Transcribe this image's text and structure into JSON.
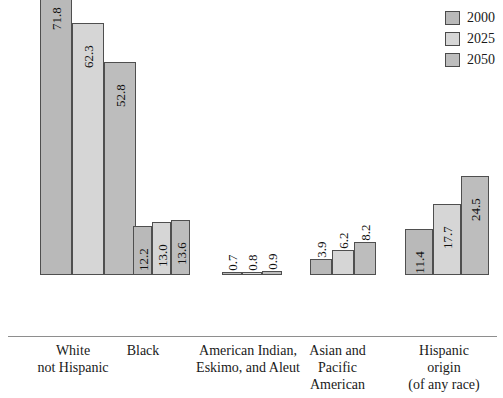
{
  "chart_data": {
    "type": "bar",
    "title": "",
    "subtitle": "",
    "xlabel": "",
    "ylabel": "",
    "ylim": [
      0,
      75
    ],
    "grid": false,
    "legend_position": "top-right",
    "categories": [
      "White not Hispanic",
      "Black",
      "American Indian, Eskimo, and Aleut",
      "Asian and Pacific American",
      "Hispanic origin (of any race)"
    ],
    "category_lines": [
      [
        "White",
        "not Hispanic"
      ],
      [
        "Black"
      ],
      [
        "American Indian,",
        "Eskimo, and Aleut"
      ],
      [
        "Asian and",
        "Pacific",
        "American"
      ],
      [
        "Hispanic",
        "origin",
        "(of any race)"
      ]
    ],
    "series": [
      {
        "name": "2000",
        "color": "#b9b9b9",
        "values": [
          71.8,
          12.2,
          0.7,
          3.9,
          11.4
        ]
      },
      {
        "name": "2025",
        "color": "#d6d6d6",
        "values": [
          62.3,
          13.0,
          0.8,
          6.2,
          17.7
        ]
      },
      {
        "name": "2050",
        "color": "#bdbdbd",
        "values": [
          52.8,
          13.6,
          0.9,
          8.2,
          24.5
        ]
      }
    ],
    "value_labels": [
      [
        "71.8",
        "62.3",
        "52.8"
      ],
      [
        "12.2",
        "13.0",
        "13.6"
      ],
      [
        "0.7",
        "0.8",
        "0.9"
      ],
      [
        "3.9",
        "6.2",
        "8.2"
      ],
      [
        "11.4",
        "17.7",
        "24.5"
      ]
    ]
  },
  "legend": {
    "items": [
      {
        "label": "2000",
        "color": "#b9b9b9"
      },
      {
        "label": "2025",
        "color": "#d6d6d6"
      },
      {
        "label": "2050",
        "color": "#bdbdbd"
      }
    ]
  },
  "colors": {
    "axis": "#8e8e8e",
    "bar_border": "#4f4f4f",
    "text": "#1a1a1a",
    "background": "#ffffff"
  }
}
